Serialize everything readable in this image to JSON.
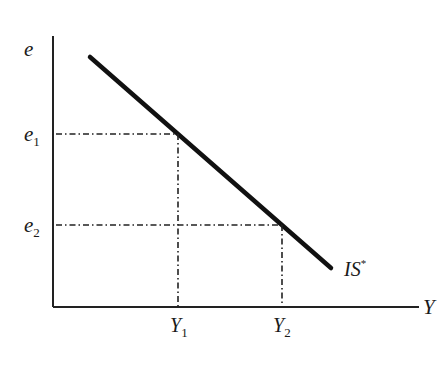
{
  "diagram": {
    "type": "IS* curve (Mundell-Fleming)",
    "axes": {
      "y_label": "e",
      "x_label": "Y"
    },
    "curve": {
      "label_main": "IS",
      "label_sup": "*",
      "start": [
        90,
        57
      ],
      "end": [
        331,
        268
      ]
    },
    "levels": [
      {
        "e_base": "e",
        "e_sub": "1",
        "Y_base": "Y",
        "Y_sub": "1"
      },
      {
        "e_base": "e",
        "e_sub": "2",
        "Y_base": "Y",
        "Y_sub": "2"
      }
    ],
    "colors": {
      "line": "#111111",
      "background": "#ffffff"
    }
  }
}
